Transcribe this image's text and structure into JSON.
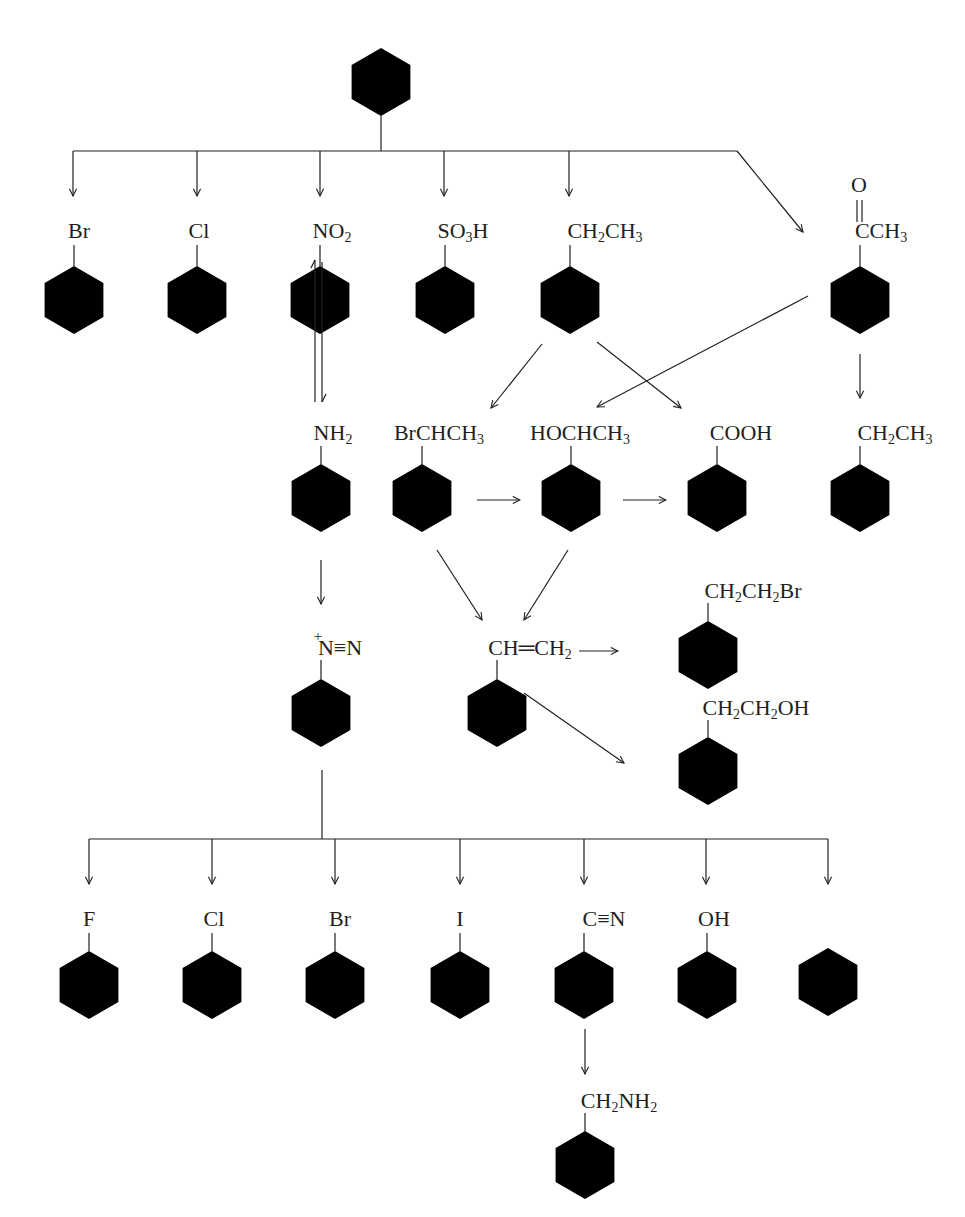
{
  "diagram": {
    "type": "reaction-scheme",
    "nodes": [
      {
        "id": "benzene",
        "label": "",
        "x": 381,
        "y": 82
      },
      {
        "id": "bromobenzene",
        "label": "Br",
        "x": 74,
        "y": 300
      },
      {
        "id": "chlorobenzene",
        "label": "Cl",
        "x": 197,
        "y": 300
      },
      {
        "id": "nitrobenzene",
        "label": "NO2",
        "x": 320,
        "y": 300
      },
      {
        "id": "benzenesulfonic",
        "label": "SO3H",
        "x": 445,
        "y": 300
      },
      {
        "id": "ethylbenzene",
        "label": "CH2CH3",
        "x": 570,
        "y": 300
      },
      {
        "id": "acetophenone",
        "label": "CCH3",
        "x": 860,
        "y": 300,
        "top": "O"
      },
      {
        "id": "aniline",
        "label": "NH2",
        "x": 321,
        "y": 498
      },
      {
        "id": "bromoethylbenzene",
        "label": "BrCHCH3",
        "x": 422,
        "y": 498
      },
      {
        "id": "phenylethanol",
        "label": "HOCHCH3",
        "x": 571,
        "y": 498
      },
      {
        "id": "benzoic-acid",
        "label": "COOH",
        "x": 717,
        "y": 498
      },
      {
        "id": "ethylbenzene-2",
        "label": "CH2CH3",
        "x": 860,
        "y": 498
      },
      {
        "id": "diazonium",
        "label": "N≡N",
        "x": 321,
        "y": 713
      },
      {
        "id": "styrene",
        "label": "CH=CH2",
        "x": 497,
        "y": 713
      },
      {
        "id": "phenethyl-bromide",
        "label": "CH2CH2Br",
        "x": 708,
        "y": 655
      },
      {
        "id": "phenethyl-alcohol",
        "label": "CH2CH2OH",
        "x": 708,
        "y": 771
      },
      {
        "id": "fluorobenzene",
        "label": "F",
        "x": 89,
        "y": 985
      },
      {
        "id": "chlorobenzene-2",
        "label": "Cl",
        "x": 212,
        "y": 985
      },
      {
        "id": "bromobenzene-2",
        "label": "Br",
        "x": 335,
        "y": 985
      },
      {
        "id": "iodobenzene",
        "label": "I",
        "x": 460,
        "y": 985
      },
      {
        "id": "benzonitrile",
        "label": "C≡N",
        "x": 584,
        "y": 985
      },
      {
        "id": "phenol",
        "label": "OH",
        "x": 707,
        "y": 985
      },
      {
        "id": "benzene-2",
        "label": "",
        "x": 828,
        "y": 982
      },
      {
        "id": "benzylamine",
        "label": "CH2NH2",
        "x": 585,
        "y": 1165
      }
    ],
    "labels": {
      "bromobenzene": {
        "main": "Br"
      },
      "chlorobenzene": {
        "main": "Cl"
      },
      "nitrobenzene": {
        "parts": [
          "NO",
          "2",
          ""
        ]
      },
      "benzenesulfonic": {
        "parts": [
          "SO",
          "3",
          "H"
        ]
      },
      "ethylbenzene": {
        "parts4": [
          "CH",
          "2",
          "CH",
          "3"
        ]
      },
      "acetophenone_top": "O",
      "acetophenone": {
        "parts": [
          "CCH",
          "3",
          ""
        ]
      },
      "aniline": {
        "parts": [
          "NH",
          "2",
          ""
        ]
      },
      "bromoethylbenzene": {
        "parts": [
          "BrCHCH",
          "3",
          ""
        ]
      },
      "phenylethanol": {
        "parts": [
          "HOCHCH",
          "3",
          ""
        ]
      },
      "benzoic": {
        "main": "COOH"
      },
      "ethylbenzene2": {
        "parts4": [
          "CH",
          "2",
          "CH",
          "3"
        ]
      },
      "diazonium": {
        "charge": "+",
        "main": "N≡N"
      },
      "styrene": {
        "a": "CH",
        "bond": "═",
        "b": "CH",
        "sub": "2"
      },
      "phenethylbromide": {
        "parts4": [
          "CH",
          "2",
          "CH",
          "2"
        ],
        "tail": "Br"
      },
      "phenethylalcohol": {
        "parts4": [
          "CH",
          "2",
          "CH",
          "2"
        ],
        "tail": "OH"
      },
      "fluoro": {
        "main": "F"
      },
      "chloro2": {
        "main": "Cl"
      },
      "bromo2": {
        "main": "Br"
      },
      "iodo": {
        "main": "I"
      },
      "nitrile": {
        "main": "C≡N"
      },
      "phenol": {
        "main": "OH"
      },
      "benzylamine": {
        "parts4": [
          "CH",
          "2",
          "NH",
          "2"
        ]
      }
    },
    "edges": [
      {
        "from": "benzene",
        "to": "bromobenzene",
        "style": "branch"
      },
      {
        "from": "benzene",
        "to": "chlorobenzene",
        "style": "branch"
      },
      {
        "from": "benzene",
        "to": "nitrobenzene",
        "style": "branch"
      },
      {
        "from": "benzene",
        "to": "benzenesulfonic",
        "style": "branch"
      },
      {
        "from": "benzene",
        "to": "ethylbenzene",
        "style": "branch"
      },
      {
        "from": "benzene",
        "to": "acetophenone",
        "style": "branch-diagonal"
      },
      {
        "from": "nitrobenzene",
        "to": "aniline",
        "style": "equilibrium"
      },
      {
        "from": "ethylbenzene",
        "to": "bromoethylbenzene"
      },
      {
        "from": "ethylbenzene",
        "to": "benzoic-acid"
      },
      {
        "from": "acetophenone",
        "to": "phenylethanol"
      },
      {
        "from": "acetophenone",
        "to": "ethylbenzene-2"
      },
      {
        "from": "bromoethylbenzene",
        "to": "phenylethanol"
      },
      {
        "from": "phenylethanol",
        "to": "benzoic-acid"
      },
      {
        "from": "aniline",
        "to": "diazonium"
      },
      {
        "from": "bromoethylbenzene",
        "to": "styrene"
      },
      {
        "from": "phenylethanol",
        "to": "styrene"
      },
      {
        "from": "styrene",
        "to": "phenethyl-bromide"
      },
      {
        "from": "styrene",
        "to": "phenethyl-alcohol"
      },
      {
        "from": "diazonium",
        "to": "fluorobenzene",
        "style": "branch"
      },
      {
        "from": "diazonium",
        "to": "chlorobenzene-2",
        "style": "branch"
      },
      {
        "from": "diazonium",
        "to": "bromobenzene-2",
        "style": "branch"
      },
      {
        "from": "diazonium",
        "to": "iodobenzene",
        "style": "branch"
      },
      {
        "from": "diazonium",
        "to": "benzonitrile",
        "style": "branch"
      },
      {
        "from": "diazonium",
        "to": "phenol",
        "style": "branch"
      },
      {
        "from": "diazonium",
        "to": "benzene-2",
        "style": "branch"
      },
      {
        "from": "benzonitrile",
        "to": "benzylamine"
      }
    ]
  }
}
